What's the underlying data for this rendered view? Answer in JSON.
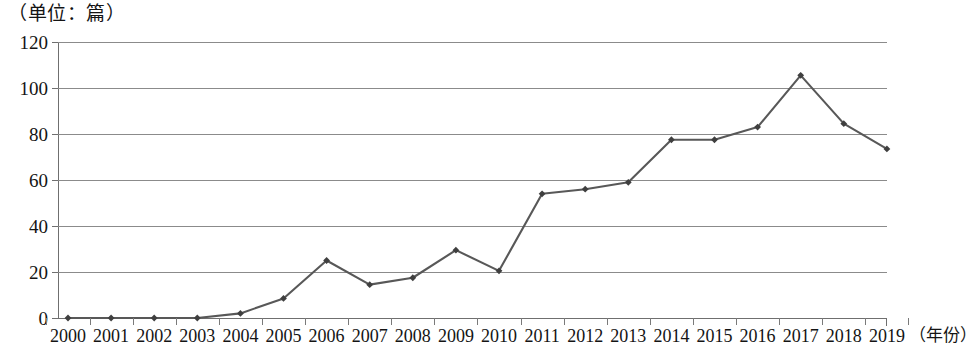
{
  "chart_data": {
    "type": "line",
    "title": "（单位：篇）",
    "xlabel": "(年份)",
    "ylabel": "",
    "unit_caption": "（单位：篇）",
    "x_axis_suffix": "（年份）",
    "categories": [
      "2000",
      "2001",
      "2002",
      "2003",
      "2004",
      "2005",
      "2006",
      "2007",
      "2008",
      "2009",
      "2010",
      "2011",
      "2012",
      "2013",
      "2014",
      "2015",
      "2016",
      "2017",
      "2018",
      "2019"
    ],
    "values": [
      0,
      0,
      0,
      0,
      2,
      8.5,
      25,
      14.5,
      17.5,
      29.5,
      20.5,
      54,
      56,
      59,
      77.5,
      77.5,
      83,
      105.5,
      84.5,
      73.5
    ],
    "series": [
      {
        "name": "发文量",
        "values": [
          0,
          0,
          0,
          0,
          2,
          8.5,
          25,
          14.5,
          17.5,
          29.5,
          20.5,
          54,
          56,
          59,
          77.5,
          77.5,
          83,
          105.5,
          84.5,
          73.5
        ]
      }
    ],
    "ylim": [
      0,
      120
    ],
    "yticks": [
      0,
      20,
      40,
      60,
      80,
      100,
      120
    ],
    "ytick_labels": [
      "0",
      "20",
      "40",
      "60",
      "80",
      "100",
      "120"
    ],
    "grid": true,
    "grid_axis": "y",
    "legend": false,
    "legend_position": "none",
    "line_color": "#585858",
    "marker_color": "#3f3f3f",
    "marker_shape": "diamond",
    "grid_color": "#8b8b8b",
    "background_color": "#ffffff"
  }
}
